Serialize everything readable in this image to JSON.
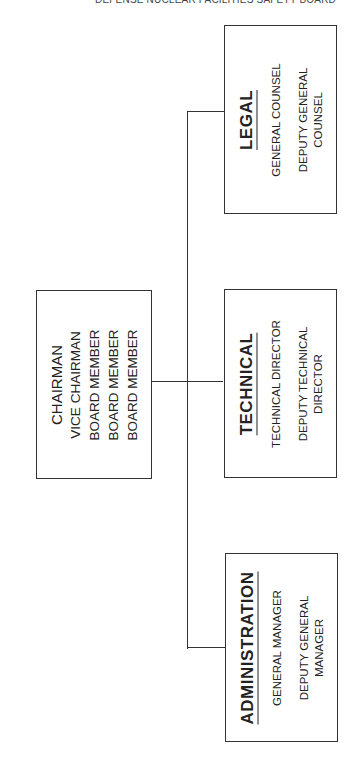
{
  "header": {
    "title": "DEFENSE NUCLEAR FACILITIES SAFETY BOARD"
  },
  "board": {
    "members": [
      "CHAIRMAN",
      "VICE CHAIRMAN",
      "BOARD MEMBER",
      "BOARD MEMBER",
      "BOARD MEMBER"
    ]
  },
  "departments": [
    {
      "title": "LEGAL",
      "roles": [
        "GENERAL COUNSEL",
        "DEPUTY GENERAL",
        "COUNSEL"
      ]
    },
    {
      "title": "TECHNICAL",
      "roles": [
        "TECHNICAL DIRECTOR",
        "DEPUTY TECHNICAL",
        "DIRECTOR"
      ]
    },
    {
      "title": "ADMINISTRATION",
      "roles": [
        "GENERAL MANAGER",
        "DEPUTY GENERAL",
        "MANAGER"
      ]
    }
  ]
}
